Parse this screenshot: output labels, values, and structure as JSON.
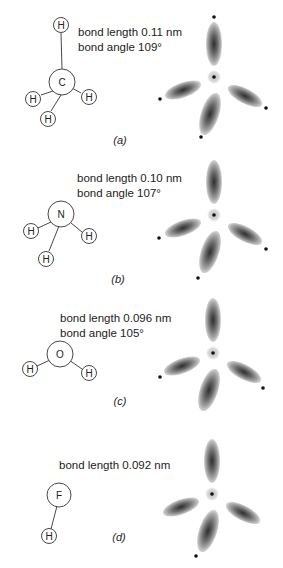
{
  "panels": [
    {
      "id": "a",
      "caption": "(a)",
      "central_atom": "C",
      "hydrogen_label": "H",
      "lines": [
        "bond length 0.11 nm",
        "bond angle 109°"
      ],
      "bonded_hydrogens": 4,
      "lone_pairs": 0
    },
    {
      "id": "b",
      "caption": "(b)",
      "central_atom": "N",
      "hydrogen_label": "H",
      "lines": [
        "bond length 0.10 nm",
        "bond angle 107°"
      ],
      "bonded_hydrogens": 3,
      "lone_pairs": 1
    },
    {
      "id": "c",
      "caption": "(c)",
      "central_atom": "O",
      "hydrogen_label": "H",
      "lines": [
        "bond length 0.096 nm",
        "bond angle 105°"
      ],
      "bonded_hydrogens": 2,
      "lone_pairs": 2
    },
    {
      "id": "d",
      "caption": "(d)",
      "central_atom": "F",
      "hydrogen_label": "H",
      "lines": [
        "bond length 0.092 nm"
      ],
      "bonded_hydrogens": 1,
      "lone_pairs": 3
    }
  ],
  "colors": {
    "ink": "#222222",
    "lobe_dark": "#3a3a3a",
    "lobe_light": "#c8c8c8",
    "nucleus_halo": "#dcdcdc"
  }
}
